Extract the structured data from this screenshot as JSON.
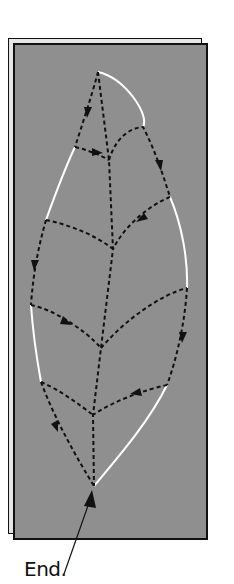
{
  "figure": {
    "type": "leaf-tracing-path-diagram",
    "label_end": "End.",
    "colors": {
      "background": "#8f8f8f",
      "leaf_outline": "#ffffff",
      "path": "#111111",
      "frame_border": "#111111",
      "back_sheet": "#e6e6e6"
    },
    "leaf": {
      "tip": [
        98,
        72
      ],
      "base": [
        94,
        486
      ]
    },
    "midrib_junctions": [
      [
        109,
        160
      ],
      [
        113,
        249
      ],
      [
        101,
        348
      ],
      [
        93,
        415
      ]
    ],
    "path_arrows_count": 10
  }
}
